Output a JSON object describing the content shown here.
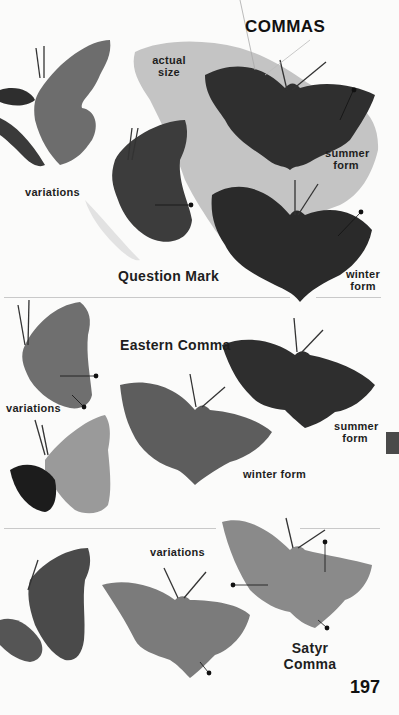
{
  "page": {
    "title": "COMMAS",
    "page_number": "197"
  },
  "sections": [
    {
      "species": "Question Mark",
      "labels": {
        "actual_size": "actual size",
        "variations": "variations",
        "summer_form": "summer form",
        "winter_form": "winter form"
      }
    },
    {
      "species": "Eastern Comma",
      "labels": {
        "variations": "variations",
        "summer_form": "summer form",
        "winter_form": "winter form"
      }
    },
    {
      "species": "Satyr Comma",
      "labels": {
        "variations": "variations"
      }
    }
  ],
  "colors": {
    "background": "#fbfbfa",
    "silhouette": "#c4c4c4",
    "ink": "#1e1e1e",
    "tab": "#4a4a4a"
  }
}
